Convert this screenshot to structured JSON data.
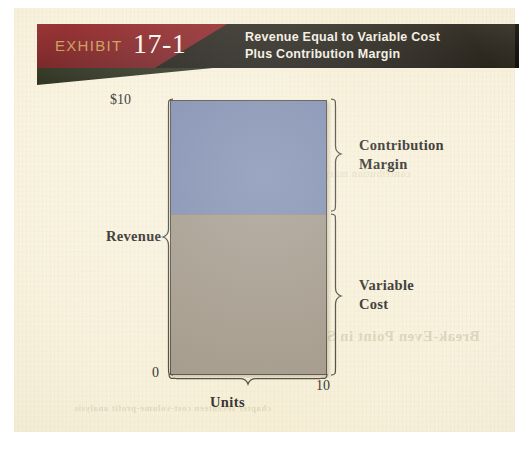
{
  "exhibit": {
    "label": "EXHIBIT",
    "number": "17-1",
    "title_line1": "Revenue Equal to Variable Cost",
    "title_line2": "Plus Contribution Margin",
    "banner_red": "#7e1a20",
    "banner_dark": "#1a1712",
    "label_color": "#c79a54"
  },
  "ghost_text": {
    "line1": "Break-Even Point in Sales Dollars",
    "line2": "chapter seventeen  cost-volume-profit analysis",
    "line3": "contribution margin"
  },
  "chart_data": {
    "type": "bar",
    "title": "Revenue Equal to Variable Cost Plus Contribution Margin",
    "xlabel": "Units",
    "ylabel": "Revenue",
    "categories": [
      "Revenue"
    ],
    "stacked": true,
    "series": [
      {
        "name": "Variable Cost",
        "values": [
          5.85
        ],
        "color": "#9c9284"
      },
      {
        "name": "Contribution Margin",
        "values": [
          4.15
        ],
        "color": "#7584ab"
      }
    ],
    "ylim": [
      0,
      10
    ],
    "xlim": [
      0,
      10
    ],
    "y_tick_labels": [
      "$10",
      "0"
    ],
    "x_tick_labels": [
      "0",
      "10"
    ],
    "grid": false,
    "legend": "right-inline-braces",
    "annotations": [
      {
        "text": "Contribution Margin",
        "segment": "Contribution Margin",
        "position": "right"
      },
      {
        "text": "Variable Cost",
        "segment": "Variable Cost",
        "position": "right"
      },
      {
        "text": "Revenue",
        "segment": "total",
        "position": "left"
      }
    ]
  },
  "axis": {
    "y_max_label": "$10",
    "y_min_label": "0",
    "x_min_label": "0",
    "x_max_label": "10",
    "x_title": "Units",
    "y_title": "Revenue"
  },
  "legend": {
    "contribution_margin_line1": "Contribution",
    "contribution_margin_line2": "Margin",
    "variable_cost_line1": "Variable",
    "variable_cost_line2": "Cost"
  }
}
